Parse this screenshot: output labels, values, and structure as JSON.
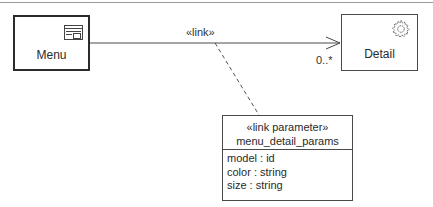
{
  "diagram": {
    "type": "UML navigation / link diagram",
    "nodes": {
      "menu": {
        "label": "Menu",
        "icon": "window-form-icon"
      },
      "detail": {
        "label": "Detail",
        "icon": "gear-icon"
      }
    },
    "association": {
      "stereotype": "«link»",
      "from": "Menu",
      "to": "Detail",
      "target_multiplicity": "0..*",
      "arrow": "open-arrowhead"
    },
    "link_parameter": {
      "stereotype": "«link parameter»",
      "name": "menu_detail_params",
      "attributes": [
        "model : id",
        "color : string",
        "size : string"
      ]
    },
    "colors": {
      "line": "#4a4a4a",
      "text": "#2a2a2a",
      "background": "#ffffff"
    }
  }
}
